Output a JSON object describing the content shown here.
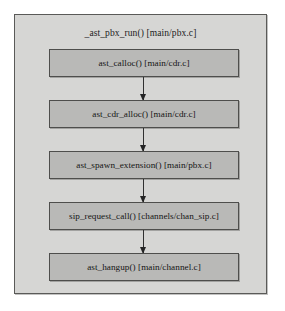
{
  "diagram": {
    "type": "flowchart",
    "orientation": "vertical",
    "container": {
      "label": "_ast_pbx_run() [main/pbx.c]",
      "fill_color": "#d6d6d4",
      "border_color": "#5a5a58"
    },
    "node_style": {
      "fill_color": "#b9b9b7",
      "border_color": "#4e4e4c",
      "text_color": "#151515"
    },
    "connector": {
      "style": "arrow",
      "direction": "down",
      "color": "#242424"
    },
    "nodes": [
      {
        "label": "ast_calloc() [main/cdr.c]"
      },
      {
        "label": "ast_cdr_alloc() [main/cdr.c]"
      },
      {
        "label": "ast_spawn_extension() [main/pbx.c]"
      },
      {
        "label": "sip_request_call() [channels/chan_sip.c]"
      },
      {
        "label": "ast_hangup() [main/channel.c]"
      }
    ]
  }
}
